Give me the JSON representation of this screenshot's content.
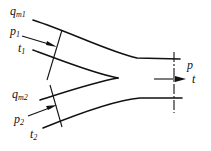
{
  "diagram": {
    "type": "flow-mixing-junction",
    "stream1": {
      "mass_flow": "q",
      "mass_flow_sub": "m1",
      "pressure": "p",
      "pressure_sub": "1",
      "temperature": "t",
      "temperature_sub": "1"
    },
    "stream2": {
      "mass_flow": "q",
      "mass_flow_sub": "m2",
      "pressure": "p",
      "pressure_sub": "2",
      "temperature": "t",
      "temperature_sub": "2"
    },
    "outlet": {
      "pressure": "p",
      "temperature": "t"
    },
    "line_color": "#111111"
  }
}
